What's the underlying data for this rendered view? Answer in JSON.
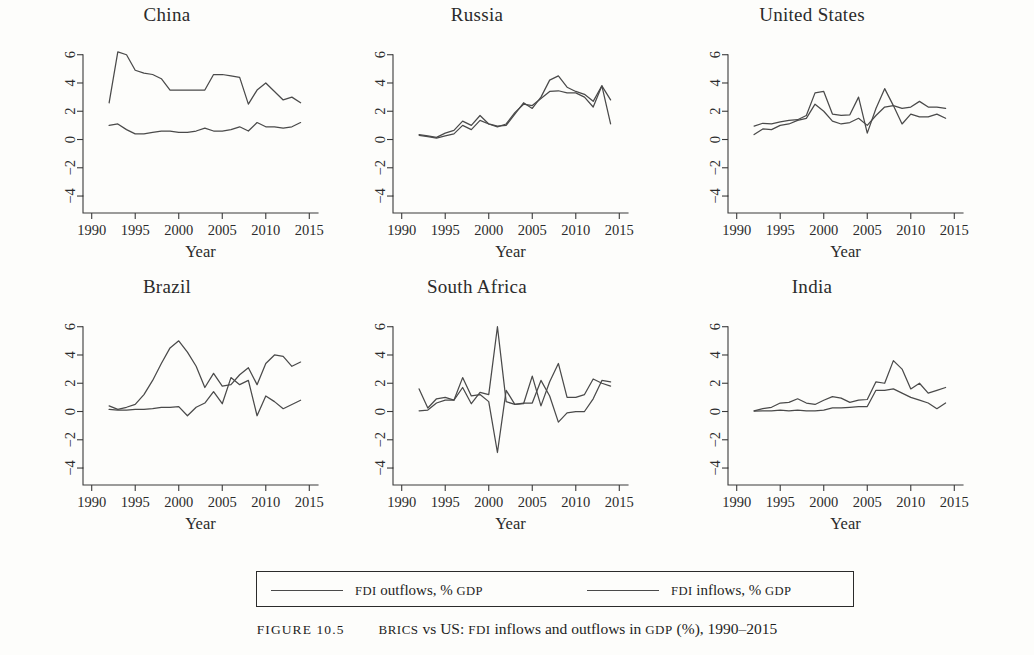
{
  "figure": {
    "caption_label": "FIGURE 10.5",
    "caption_text_parts": {
      "brics": "BRICS",
      "vs": " vs ",
      "us": "US",
      "mid1": ": ",
      "fdi": "FDI",
      "mid2": " inflows and outflows in ",
      "gdp": "GDP",
      "tail": " (%), 1990–2015"
    },
    "caption_full": "FIGURE 10.5   BRICS vs US: FDI inflows and outflows in GDP (%), 1990–2015"
  },
  "legend": {
    "position": "below-panels",
    "entries": [
      {
        "label_main": "FDI",
        "label_rest": " outflows, % ",
        "label_tail": "GDP",
        "full": "FDI outflows, % GDP",
        "color": "#4a4a4a"
      },
      {
        "label_main": "FDI",
        "label_rest": " inflows, % ",
        "label_tail": "GDP",
        "full": "FDI inflows, % GDP",
        "color": "#4a4a4a"
      }
    ]
  },
  "axes": {
    "xlabel": "Year",
    "xticks": [
      1990,
      1995,
      2000,
      2005,
      2010,
      2015
    ],
    "xlim": [
      1989,
      2016
    ],
    "yticks": [
      -4,
      -2,
      0,
      2,
      4,
      6
    ],
    "ylim": [
      -5.2,
      6.9
    ],
    "grid": false
  },
  "chart_data": [
    {
      "type": "line",
      "title": "China",
      "xlabel": "Year",
      "ylabel": "",
      "xlim": [
        1989,
        2016
      ],
      "ylim": [
        -5.2,
        6.9
      ],
      "xticks": [
        1990,
        1995,
        2000,
        2005,
        2010,
        2015
      ],
      "yticks": [
        -4,
        -2,
        0,
        2,
        4,
        6
      ],
      "grid": false,
      "x": [
        1992,
        1993,
        1994,
        1995,
        1996,
        1997,
        1998,
        1999,
        2000,
        2001,
        2002,
        2003,
        2004,
        2005,
        2006,
        2007,
        2008,
        2009,
        2010,
        2011,
        2012,
        2013,
        2014
      ],
      "series": [
        {
          "name": "FDI inflows, % GDP",
          "values": [
            2.6,
            6.2,
            6.0,
            4.9,
            4.7,
            4.6,
            4.3,
            3.5,
            3.5,
            3.5,
            3.5,
            3.5,
            4.6,
            4.6,
            4.5,
            4.4,
            2.5,
            3.5,
            4.0,
            3.4,
            2.8,
            3.0,
            2.6
          ]
        },
        {
          "name": "FDI outflows, % GDP",
          "values": [
            1.0,
            1.1,
            0.7,
            0.4,
            0.4,
            0.5,
            0.6,
            0.6,
            0.5,
            0.5,
            0.6,
            0.8,
            0.6,
            0.6,
            0.7,
            0.9,
            0.6,
            1.2,
            0.9,
            0.9,
            0.8,
            0.9,
            1.2
          ]
        }
      ]
    },
    {
      "type": "line",
      "title": "Russia",
      "xlabel": "Year",
      "ylabel": "",
      "xlim": [
        1989,
        2016
      ],
      "ylim": [
        -5.2,
        6.9
      ],
      "xticks": [
        1990,
        1995,
        2000,
        2005,
        2010,
        2015
      ],
      "yticks": [
        -4,
        -2,
        0,
        2,
        4,
        6
      ],
      "grid": false,
      "x": [
        1992,
        1993,
        1994,
        1995,
        1996,
        1997,
        1998,
        1999,
        2000,
        2001,
        2002,
        2003,
        2004,
        2005,
        2006,
        2007,
        2008,
        2009,
        2010,
        2011,
        2012,
        2013,
        2014
      ],
      "series": [
        {
          "name": "FDI inflows, % GDP",
          "values": [
            0.35,
            0.25,
            0.15,
            0.45,
            0.65,
            1.3,
            1.0,
            1.7,
            1.1,
            0.95,
            1.0,
            1.8,
            2.6,
            2.2,
            3.0,
            4.2,
            4.5,
            3.7,
            3.4,
            3.2,
            2.7,
            3.8,
            2.8
          ]
        },
        {
          "name": "FDI outflows, % GDP",
          "values": [
            0.3,
            0.2,
            0.1,
            0.25,
            0.4,
            1.0,
            0.7,
            1.35,
            1.1,
            0.9,
            1.1,
            1.9,
            2.5,
            2.4,
            2.9,
            3.4,
            3.45,
            3.3,
            3.3,
            3.0,
            2.3,
            3.8,
            1.1
          ]
        }
      ]
    },
    {
      "type": "line",
      "title": "United States",
      "xlabel": "Year",
      "ylabel": "",
      "xlim": [
        1989,
        2016
      ],
      "ylim": [
        -5.2,
        6.9
      ],
      "xticks": [
        1990,
        1995,
        2000,
        2005,
        2010,
        2015
      ],
      "yticks": [
        -4,
        -2,
        0,
        2,
        4,
        6
      ],
      "grid": false,
      "x": [
        1992,
        1993,
        1994,
        1995,
        1996,
        1997,
        1998,
        1999,
        2000,
        2001,
        2002,
        2003,
        2004,
        2005,
        2006,
        2007,
        2008,
        2009,
        2010,
        2011,
        2012,
        2013,
        2014
      ],
      "series": [
        {
          "name": "FDI inflows, % GDP",
          "values": [
            0.35,
            0.75,
            0.7,
            1.0,
            1.1,
            1.35,
            1.5,
            2.5,
            2.0,
            1.3,
            1.1,
            1.2,
            1.5,
            1.0,
            1.7,
            2.3,
            2.4,
            1.1,
            1.8,
            1.6,
            1.6,
            1.8,
            1.5
          ]
        },
        {
          "name": "FDI outflows, % GDP",
          "values": [
            0.95,
            1.15,
            1.1,
            1.25,
            1.35,
            1.4,
            1.7,
            3.3,
            3.4,
            1.8,
            1.7,
            1.75,
            3.0,
            0.45,
            2.2,
            3.6,
            2.4,
            2.2,
            2.3,
            2.7,
            2.3,
            2.3,
            2.2
          ]
        }
      ]
    },
    {
      "type": "line",
      "title": "Brazil",
      "xlabel": "Year",
      "ylabel": "",
      "xlim": [
        1989,
        2016
      ],
      "ylim": [
        -5.2,
        6.9
      ],
      "xticks": [
        1990,
        1995,
        2000,
        2005,
        2010,
        2015
      ],
      "yticks": [
        -4,
        -2,
        0,
        2,
        4,
        6
      ],
      "grid": false,
      "x": [
        1992,
        1993,
        1994,
        1995,
        1996,
        1997,
        1998,
        1999,
        2000,
        2001,
        2002,
        2003,
        2004,
        2005,
        2006,
        2007,
        2008,
        2009,
        2010,
        2011,
        2012,
        2013,
        2014
      ],
      "series": [
        {
          "name": "FDI inflows, % GDP",
          "values": [
            0.4,
            0.15,
            0.3,
            0.5,
            1.2,
            2.2,
            3.4,
            4.5,
            5.0,
            4.2,
            3.2,
            1.7,
            2.7,
            1.8,
            1.9,
            2.6,
            3.1,
            1.9,
            3.4,
            4.0,
            3.9,
            3.2,
            3.5
          ]
        },
        {
          "name": "FDI outflows, % GDP",
          "values": [
            0.15,
            0.1,
            0.1,
            0.15,
            0.15,
            0.2,
            0.3,
            0.3,
            0.35,
            -0.3,
            0.3,
            0.6,
            1.4,
            0.55,
            2.4,
            1.9,
            2.2,
            -0.3,
            1.1,
            0.7,
            0.2,
            0.5,
            0.8
          ]
        }
      ]
    },
    {
      "type": "line",
      "title": "South Africa",
      "xlabel": "Year",
      "ylabel": "",
      "xlim": [
        1989,
        2016
      ],
      "ylim": [
        -5.2,
        6.9
      ],
      "xticks": [
        1990,
        1995,
        2000,
        2005,
        2010,
        2015
      ],
      "yticks": [
        -4,
        -2,
        0,
        2,
        4,
        6
      ],
      "grid": false,
      "x": [
        1992,
        1993,
        1994,
        1995,
        1996,
        1997,
        1998,
        1999,
        2000,
        2001,
        2002,
        2003,
        2004,
        2005,
        2006,
        2007,
        2008,
        2009,
        2010,
        2011,
        2012,
        2013,
        2014
      ],
      "series": [
        {
          "name": "FDI inflows, % GDP",
          "values": [
            1.6,
            0.25,
            0.9,
            1.0,
            0.8,
            1.7,
            0.55,
            1.35,
            1.2,
            6.0,
            0.7,
            0.5,
            0.55,
            2.5,
            0.4,
            2.1,
            3.4,
            1.0,
            1.0,
            1.2,
            2.3,
            2.0,
            1.8
          ]
        },
        {
          "name": "FDI outflows, % GDP",
          "values": [
            0.05,
            0.1,
            0.6,
            0.8,
            0.8,
            2.4,
            1.1,
            1.2,
            0.7,
            -2.9,
            1.5,
            0.5,
            0.6,
            0.6,
            2.2,
            1.1,
            -0.75,
            -0.1,
            0.0,
            0.0,
            0.9,
            2.2,
            2.1
          ]
        }
      ]
    },
    {
      "type": "line",
      "title": "India",
      "xlabel": "Year",
      "ylabel": "",
      "xlim": [
        1989,
        2016
      ],
      "ylim": [
        -5.2,
        6.9
      ],
      "xticks": [
        1990,
        1995,
        2000,
        2005,
        2010,
        2015
      ],
      "yticks": [
        -4,
        -2,
        0,
        2,
        4,
        6
      ],
      "grid": false,
      "x": [
        1992,
        1993,
        1994,
        1995,
        1996,
        1997,
        1998,
        1999,
        2000,
        2001,
        2002,
        2003,
        2004,
        2005,
        2006,
        2007,
        2008,
        2009,
        2010,
        2011,
        2012,
        2013,
        2014
      ],
      "series": [
        {
          "name": "FDI inflows, % GDP",
          "values": [
            0.05,
            0.2,
            0.3,
            0.6,
            0.65,
            0.9,
            0.6,
            0.5,
            0.8,
            1.05,
            0.95,
            0.65,
            0.8,
            0.85,
            2.1,
            2.0,
            3.6,
            3.0,
            1.6,
            2.0,
            1.3,
            1.5,
            1.7
          ]
        },
        {
          "name": "FDI outflows, % GDP",
          "values": [
            0.03,
            0.05,
            0.05,
            0.1,
            0.05,
            0.1,
            0.05,
            0.05,
            0.1,
            0.25,
            0.25,
            0.3,
            0.35,
            0.35,
            1.5,
            1.5,
            1.6,
            1.3,
            1.0,
            0.8,
            0.6,
            0.2,
            0.6
          ]
        }
      ]
    }
  ],
  "panels": [
    {
      "title": "China",
      "col": 0,
      "row": 0
    },
    {
      "title": "Russia",
      "col": 1,
      "row": 0
    },
    {
      "title": "United States",
      "col": 2,
      "row": 0
    },
    {
      "title": "Brazil",
      "col": 0,
      "row": 1
    },
    {
      "title": "South Africa",
      "col": 1,
      "row": 1
    },
    {
      "title": "India",
      "col": 2,
      "row": 1
    }
  ]
}
